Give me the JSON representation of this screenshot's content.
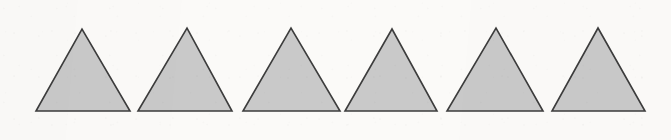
{
  "document": {
    "kind": "scanned-figure",
    "description": "Row of six identical shaded triangles",
    "width": 671,
    "height": 140,
    "background_color": "#fbfaf8",
    "paper_tint": "#fbfaf8"
  },
  "figure": {
    "shape_name": "triangle",
    "shape_count": 6,
    "fill_color": "#c9c9c9",
    "stroke_color": "#3d3d3d",
    "stroke_width": 1.6,
    "baseline_y": 111,
    "apex_y": 29,
    "shapes": [
      {
        "index": 1,
        "label": "triangle-1",
        "points": "36,111 130,111 82,29",
        "base_left_x": 36,
        "base_right_x": 130,
        "apex_x": 82,
        "base_width": 94,
        "height": 82
      },
      {
        "index": 2,
        "label": "triangle-2",
        "points": "138,111 232,111 187,28",
        "base_left_x": 138,
        "base_right_x": 232,
        "apex_x": 187,
        "base_width": 94,
        "height": 83
      },
      {
        "index": 3,
        "label": "triangle-3",
        "points": "243,111 340,111 291,28",
        "base_left_x": 243,
        "base_right_x": 340,
        "apex_x": 291,
        "base_width": 97,
        "height": 83
      },
      {
        "index": 4,
        "label": "triangle-4",
        "points": "345,111 437,111 392,29",
        "base_left_x": 345,
        "base_right_x": 437,
        "apex_x": 392,
        "base_width": 92,
        "height": 82
      },
      {
        "index": 5,
        "label": "triangle-5",
        "points": "447,111 543,111 496,28",
        "base_left_x": 447,
        "base_right_x": 543,
        "apex_x": 496,
        "base_width": 96,
        "height": 83
      },
      {
        "index": 6,
        "label": "triangle-6",
        "points": "552,111 645,111 598,28",
        "base_left_x": 552,
        "base_right_x": 645,
        "apex_x": 598,
        "base_width": 93,
        "height": 83
      }
    ]
  }
}
